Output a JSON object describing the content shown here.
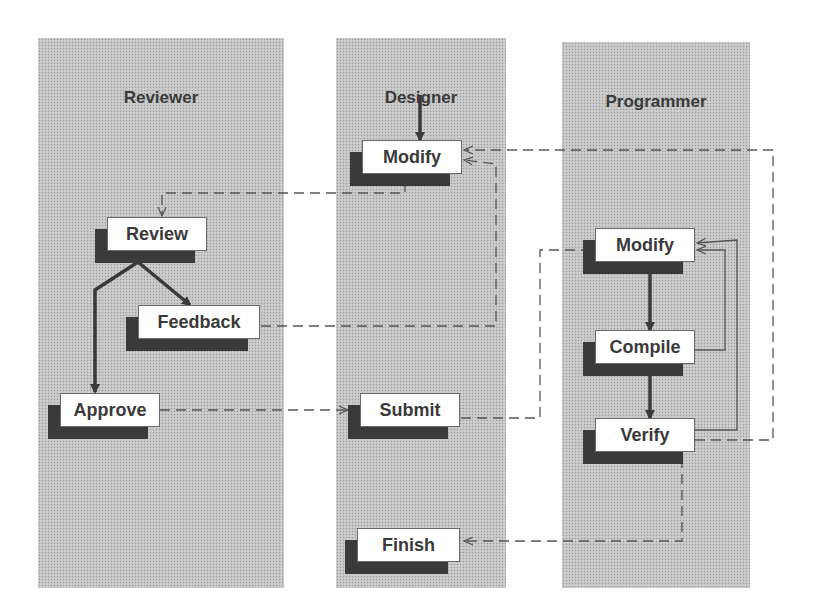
{
  "lanes": [
    {
      "id": "reviewer",
      "title": "Reviewer"
    },
    {
      "id": "designer",
      "title": "Designer"
    },
    {
      "id": "programmer",
      "title": "Programmer"
    }
  ],
  "nodes": {
    "designer_modify": "Modify",
    "review": "Review",
    "feedback": "Feedback",
    "approve": "Approve",
    "submit": "Submit",
    "finish": "Finish",
    "programmer_modify": "Modify",
    "compile": "Compile",
    "verify": "Verify"
  },
  "edges": [
    {
      "from": "start",
      "to": "designer_modify",
      "style": "solid"
    },
    {
      "from": "designer_modify",
      "to": "review",
      "style": "dashed"
    },
    {
      "from": "review",
      "to": "feedback",
      "style": "solid"
    },
    {
      "from": "review",
      "to": "approve",
      "style": "solid"
    },
    {
      "from": "feedback",
      "to": "designer_modify",
      "style": "dashed"
    },
    {
      "from": "approve",
      "to": "submit",
      "style": "dashed"
    },
    {
      "from": "submit",
      "to": "programmer_modify",
      "style": "dashed"
    },
    {
      "from": "programmer_modify",
      "to": "compile",
      "style": "solid"
    },
    {
      "from": "compile",
      "to": "verify",
      "style": "solid"
    },
    {
      "from": "compile",
      "to": "programmer_modify",
      "style": "thin"
    },
    {
      "from": "verify",
      "to": "programmer_modify",
      "style": "thin"
    },
    {
      "from": "verify",
      "to": "designer_modify",
      "style": "dashed"
    },
    {
      "from": "verify",
      "to": "finish",
      "style": "dashed"
    }
  ],
  "colors": {
    "lane": "#c4c4c4",
    "shadow": "#3a3a3a",
    "text": "#3a3a3a",
    "line": "#555555"
  }
}
